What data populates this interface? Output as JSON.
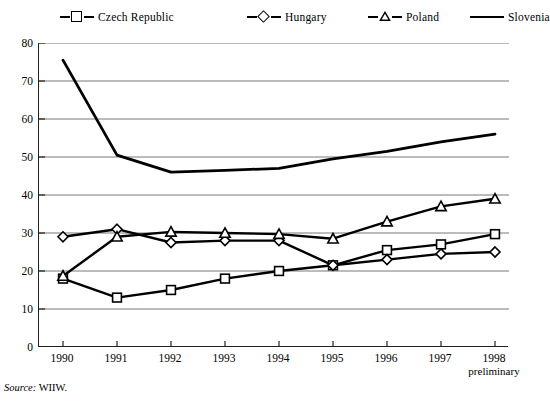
{
  "chart_data": {
    "type": "line",
    "title": "",
    "subtitle": "",
    "xlabel": "",
    "ylabel": "",
    "x": [
      "1990",
      "1991",
      "1992",
      "1993",
      "1994",
      "1995",
      "1996",
      "1997",
      "1998"
    ],
    "x_tick_sublabels": [
      "",
      "",
      "",
      "",
      "",
      "",
      "",
      "",
      "preliminary"
    ],
    "ylim": [
      0,
      80
    ],
    "yticks": [
      0,
      10,
      20,
      30,
      40,
      50,
      60,
      70,
      80
    ],
    "grid": "horizontal",
    "legend_position": "top",
    "series": [
      {
        "name": "Czech Republic",
        "marker": "square",
        "color": "#000000",
        "values": [
          18,
          13,
          15,
          18,
          20,
          21.5,
          25.5,
          27,
          29.7
        ]
      },
      {
        "name": "Hungary",
        "marker": "diamond",
        "color": "#000000",
        "values": [
          29,
          31,
          27.5,
          28,
          28,
          21.5,
          23,
          24.5,
          25
        ]
      },
      {
        "name": "Poland",
        "marker": "triangle",
        "color": "#000000",
        "values": [
          18.7,
          29,
          30.3,
          30,
          29.7,
          28.5,
          33,
          37,
          39
        ]
      },
      {
        "name": "Slovenia",
        "marker": "none",
        "color": "#000000",
        "values": [
          75.5,
          50.5,
          46,
          46.5,
          47,
          49.5,
          51.5,
          54,
          56
        ]
      }
    ]
  },
  "legend": {
    "items": [
      {
        "label": "Czech Republic",
        "marker": "square"
      },
      {
        "label": "Hungary",
        "marker": "diamond"
      },
      {
        "label": "Poland",
        "marker": "triangle"
      },
      {
        "label": "Slovenia",
        "marker": "none"
      }
    ]
  },
  "source": {
    "prefix": "Source:",
    "text": "WIIW."
  },
  "colors": {
    "line": "#000000",
    "grid": "#555555",
    "axis": "#222222",
    "background": "#ffffff"
  }
}
